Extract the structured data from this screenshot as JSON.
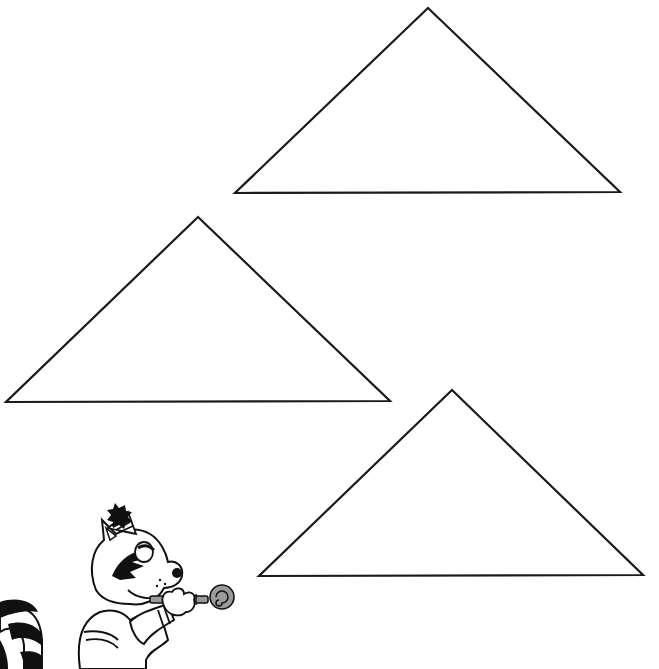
{
  "page": {
    "background": "#ffffff",
    "stroke_color": "#1a1a1a"
  },
  "triangles": [
    {
      "id": "triangle-top-right",
      "apex": [
        428,
        8
      ],
      "left": [
        235,
        193
      ],
      "right": [
        620,
        192
      ]
    },
    {
      "id": "triangle-middle-left",
      "apex": [
        198,
        217
      ],
      "left": [
        6,
        402
      ],
      "right": [
        390,
        401
      ]
    },
    {
      "id": "triangle-bottom-right",
      "apex": [
        452,
        390
      ],
      "left": [
        259,
        576
      ],
      "right": [
        643,
        575
      ]
    }
  ],
  "illustration": {
    "subject": "raccoon-with-party-hat-and-party-horn",
    "tail_colors": [
      "#111111",
      "#ffffff"
    ],
    "horn_color": "#9a9a9a"
  }
}
